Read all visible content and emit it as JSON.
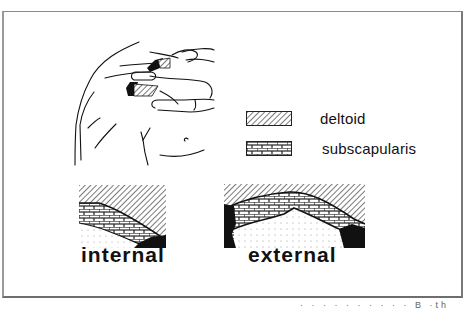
{
  "figure": {
    "legend": [
      {
        "label": "deltoid",
        "pattern": "diagonal-hatch"
      },
      {
        "label": "subscapularis",
        "pattern": "brick"
      }
    ],
    "panels": [
      {
        "label": "internal"
      },
      {
        "label": "external"
      }
    ],
    "footer_fragment": "· ·    · ·   ·     ·  ·  · ·    ·   B  ·th"
  },
  "colors": {
    "ink": "#111111",
    "frame": "#7a7a7a",
    "background": "#ffffff"
  }
}
